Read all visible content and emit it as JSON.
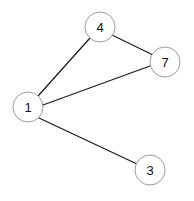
{
  "diagram": {
    "type": "node-link-graph",
    "width": 194,
    "height": 201,
    "background_color": "#ffffff",
    "node_fill_color": "#ffffff",
    "node_stroke_color": "#9a9a9a",
    "edge_color": "#1b1b1b",
    "label_color": "#111111",
    "node_radius": 15,
    "nodes": [
      {
        "id": "4",
        "label": "4",
        "cx": 100,
        "cy": 27
      },
      {
        "id": "7",
        "label": "7",
        "cx": 165,
        "cy": 62
      },
      {
        "id": "1",
        "label": "1",
        "cx": 28,
        "cy": 107
      },
      {
        "id": "3",
        "label": "3",
        "cx": 150,
        "cy": 170
      }
    ],
    "edges": [
      {
        "source": "1",
        "target": "4",
        "x1": 38,
        "y1": 96,
        "x2": 90,
        "y2": 38
      },
      {
        "source": "4",
        "target": "7",
        "x1": 112,
        "y1": 35,
        "x2": 153,
        "y2": 55
      },
      {
        "source": "1",
        "target": "7",
        "x1": 43,
        "y1": 105,
        "x2": 150,
        "y2": 66
      },
      {
        "source": "1",
        "target": "3",
        "x1": 39,
        "y1": 118,
        "x2": 137,
        "y2": 164
      }
    ]
  }
}
